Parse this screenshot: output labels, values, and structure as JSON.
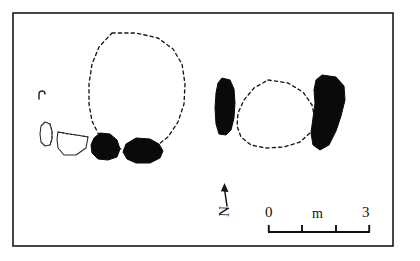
{
  "figure": {
    "kind": "archaeological-site-plan",
    "background_color": "#ffffff",
    "ink_color": "#111111",
    "frame": {
      "x": 13,
      "y": 13,
      "width": 380,
      "height": 233,
      "stroke_color": "#1a1a1a"
    }
  },
  "scale_bar": {
    "label_start": "0",
    "label_unit": "m",
    "label_end": "3",
    "x_start": 268,
    "x_end": 370,
    "y": 232,
    "segments": 3,
    "tick_positions": [
      268,
      302,
      336,
      370
    ]
  },
  "north_indicator": {
    "label": "N",
    "arrow_x": 226,
    "arrow_tip_y": 184,
    "arrow_base_y": 206,
    "rotation_degrees": -88
  },
  "features": [
    {
      "id": "large-dashed-enclosure",
      "name": "large-dashed-enclosure",
      "style": "dashed",
      "description": "Large rounded dashed outline in the upper-left-centre of the plan",
      "points": "112,33 136,33 158,38 173,49 182,64 185,84 184,104 178,122 168,137 155,147 140,151 124,150 110,145 99,135 92,121 89,104 89,84 92,64 99,47 112,33"
    },
    {
      "id": "right-dashed-enclosure",
      "name": "right-dashed-enclosure",
      "style": "dashed",
      "description": "Oval dashed outline between the two right-hand stones",
      "points": "268,80 288,83 303,92 312,105 315,119 311,132 300,142 284,147 266,148 251,145 241,137 237,126 238,113 244,100 254,88 268,80"
    },
    {
      "id": "stone-left-cluster-a",
      "name": "stone-filled-left-a",
      "style": "filled",
      "description": "Black filled stone, left of the pair below the large enclosure",
      "points": "100,133 110,134 117,140 120,149 117,157 108,160 98,159 92,153 91,145 94,138 100,133"
    },
    {
      "id": "stone-left-cluster-b",
      "name": "stone-filled-left-b",
      "style": "filled",
      "description": "Larger black filled stone, right of the pair below the large enclosure",
      "points": "136,138 150,139 159,144 163,151 160,158 150,163 136,163 127,159 123,152 126,144 136,138"
    },
    {
      "id": "stone-right-cluster-west",
      "name": "stone-filled-right-west",
      "style": "filled",
      "description": "Tall black stone on the west side of the right enclosure",
      "points": "222,78 230,80 234,89 235,103 234,118 231,130 226,135 219,134 216,124 215,108 216,93 218,83 222,78"
    },
    {
      "id": "stone-right-cluster-east",
      "name": "stone-filled-right-east",
      "style": "filled",
      "description": "Large angled black stone on the east side of the right enclosure",
      "points": "322,75 336,77 344,86 345,100 341,116 336,131 329,145 320,150 313,145 311,133 313,118 315,103 314,90 316,80 322,75"
    },
    {
      "id": "outline-blob-small",
      "name": "outline-stone-small",
      "style": "outline",
      "description": "Small unfilled outlined stone at far left",
      "points": "45,122 50,124 52,131 52,139 50,145 45,146 41,142 40,134 41,126 45,122"
    },
    {
      "id": "outline-trapezoid",
      "name": "outline-stone-trapezoid",
      "style": "outline",
      "description": "Unfilled trapezoidal stone outline with dotted upper edge",
      "points": "58,132 88,137 86,148 76,155 64,155 58,148 57,139 58,132"
    },
    {
      "id": "outline-trapezoid-dotted-edge",
      "name": "outline-stone-dotted-edge",
      "style": "dotted",
      "description": "Dotted upper edge of the trapezoidal stone outline",
      "points": "58,132 68,134 78,135 88,137"
    },
    {
      "id": "outline-blob-dotted-edge",
      "name": "outline-small-dotted-edge",
      "style": "dotted",
      "description": "Dotted right edge of the small outlined stone",
      "points": "50,124 52,131 52,139 50,145"
    },
    {
      "id": "hook-mark",
      "name": "small-hook-mark",
      "style": "outline",
      "description": "Tiny comma-shaped mark at upper left of the plan",
      "path": "M 39,99 L 39,94 Q 39,91 42,91 Q 45,91 45,94"
    }
  ]
}
